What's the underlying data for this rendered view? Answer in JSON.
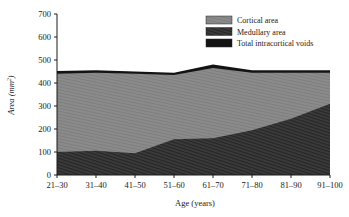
{
  "chart_data": {
    "type": "area",
    "title": "",
    "xlabel": "Age (years)",
    "ylabel": "Area (mm²)",
    "categories": [
      "21–30",
      "31–40",
      "41–50",
      "51–60",
      "61–70",
      "71–80",
      "81–90",
      "91–100"
    ],
    "series": [
      {
        "name": "Medullary area",
        "values": [
          100,
          105,
          95,
          155,
          160,
          195,
          245,
          310
        ],
        "color": "#3a3a3a",
        "pattern": "diagonal-hatch"
      },
      {
        "name": "Cortical area",
        "values": [
          340,
          340,
          345,
          280,
          305,
          250,
          200,
          135
        ],
        "color": "#8a8a8a",
        "pattern": "fine-hatch"
      },
      {
        "name": "Total intracortical voids",
        "values": [
          12,
          10,
          10,
          10,
          15,
          10,
          10,
          10
        ],
        "color": "#111111",
        "pattern": "solid"
      }
    ],
    "stacked_totals": [
      452,
      455,
      450,
      445,
      480,
      455,
      455,
      455
    ],
    "ylim": [
      0,
      700
    ],
    "yticks": [
      0,
      100,
      200,
      300,
      400,
      500,
      600,
      700
    ],
    "ytick_labels": [
      "0",
      "100",
      "200",
      "300",
      "400",
      "500",
      "600",
      "700"
    ],
    "grid": false,
    "legend_position": "top-right",
    "legend_entries": [
      {
        "label": "Cortical area",
        "color": "#8a8a8a"
      },
      {
        "label": "Medullary area",
        "color": "#3a3a3a"
      },
      {
        "label": "Total intracortical voids",
        "color": "#111111"
      }
    ]
  },
  "axes": {
    "y_title": "Area (mm²)",
    "y_title_main": "Area (mm",
    "y_title_sup": "2",
    "y_title_close": ")",
    "x_title": "Age (years)"
  }
}
